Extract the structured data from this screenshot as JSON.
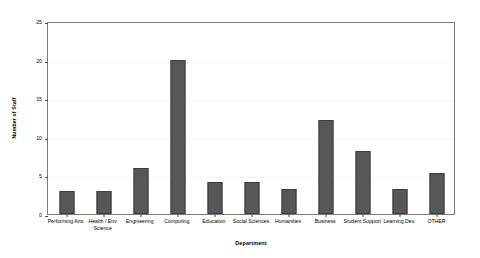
{
  "chart_data": {
    "type": "bar",
    "title": "",
    "xlabel": "Department",
    "ylabel": "Number of Staff",
    "categories": [
      "Performing Arts",
      "Health / Env Science",
      "Engineering",
      "Computing",
      "Education",
      "Social Sciences",
      "Humanities",
      "Business",
      "Student Support",
      "Learning Dev.",
      "OTHER"
    ],
    "values": [
      3,
      3,
      6,
      20,
      4.2,
      4.2,
      3.2,
      12.2,
      8.2,
      3.3,
      5.3
    ],
    "ylim": [
      0,
      25
    ],
    "yticks": [
      0,
      5,
      10,
      15,
      20,
      25
    ],
    "grid": true,
    "legend": false,
    "bar_color": "#575757",
    "bar_edge_color": "#3d3d3d",
    "frame_color": "#7a7a7a",
    "gridline_color": "#f2f2f2",
    "background": "#ffffff"
  }
}
